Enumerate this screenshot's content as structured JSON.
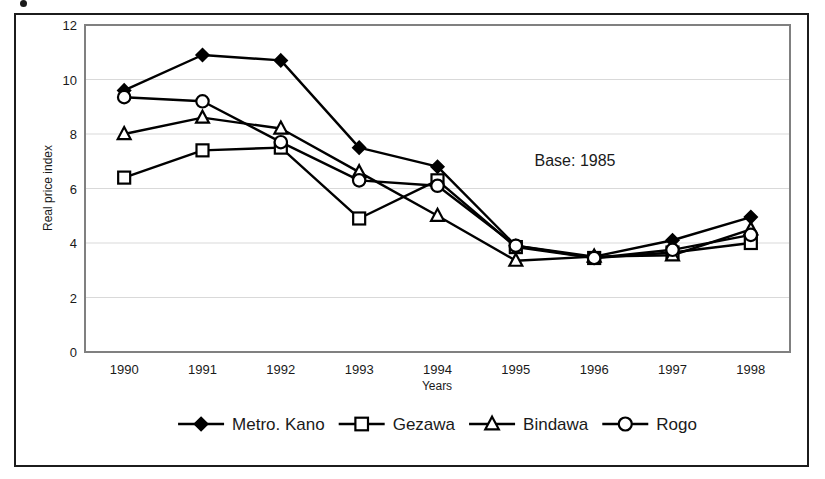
{
  "figure": {
    "annotation": "Base: 1985",
    "accent_color": "#000000",
    "plot_border_color": "#808080",
    "gridline_color": "#d9d9d9",
    "frame_color": "#1c1c1c"
  },
  "chart_data": {
    "type": "line",
    "title": "",
    "subtitle": "",
    "xlabel": "Years",
    "ylabel": "Real price index",
    "categories": [
      "1990",
      "1991",
      "1992",
      "1993",
      "1994",
      "1995",
      "1996",
      "1997",
      "1998"
    ],
    "x_tick_labels": [
      "1990",
      "1991",
      "1992",
      "1993",
      "1994",
      "1995",
      "1996",
      "1997",
      "1998"
    ],
    "y_tick_labels": [
      "0",
      "2",
      "4",
      "6",
      "8",
      "10",
      "12"
    ],
    "y_ticks": [
      0,
      2,
      4,
      6,
      8,
      10,
      12
    ],
    "ylim": [
      0,
      12
    ],
    "grid": "horizontal",
    "legend_position": "bottom",
    "annotations": [
      {
        "text": "Base: 1985",
        "x": "1994.6",
        "y": "7.0"
      }
    ],
    "series": [
      {
        "name": "Metro. Kano",
        "marker": "filled-diamond",
        "values": [
          9.6,
          10.9,
          10.7,
          7.5,
          6.8,
          3.9,
          3.5,
          4.1,
          4.95
        ]
      },
      {
        "name": "Gezawa",
        "marker": "open-square",
        "values": [
          6.4,
          7.4,
          7.5,
          4.9,
          6.3,
          3.85,
          3.45,
          3.65,
          4.0
        ]
      },
      {
        "name": "Bindawa",
        "marker": "open-triangle",
        "values": [
          8.0,
          8.6,
          8.2,
          6.6,
          5.0,
          3.35,
          3.5,
          3.55,
          4.5
        ]
      },
      {
        "name": "Rogo",
        "marker": "open-circle",
        "values": [
          9.35,
          9.2,
          7.7,
          6.3,
          6.1,
          3.9,
          3.45,
          3.75,
          4.3
        ]
      }
    ]
  },
  "legend": {
    "items": [
      {
        "label": "Metro. Kano",
        "marker": "filled-diamond"
      },
      {
        "label": "Gezawa",
        "marker": "open-square"
      },
      {
        "label": "Bindawa",
        "marker": "open-triangle"
      },
      {
        "label": "Rogo",
        "marker": "open-circle"
      }
    ]
  }
}
